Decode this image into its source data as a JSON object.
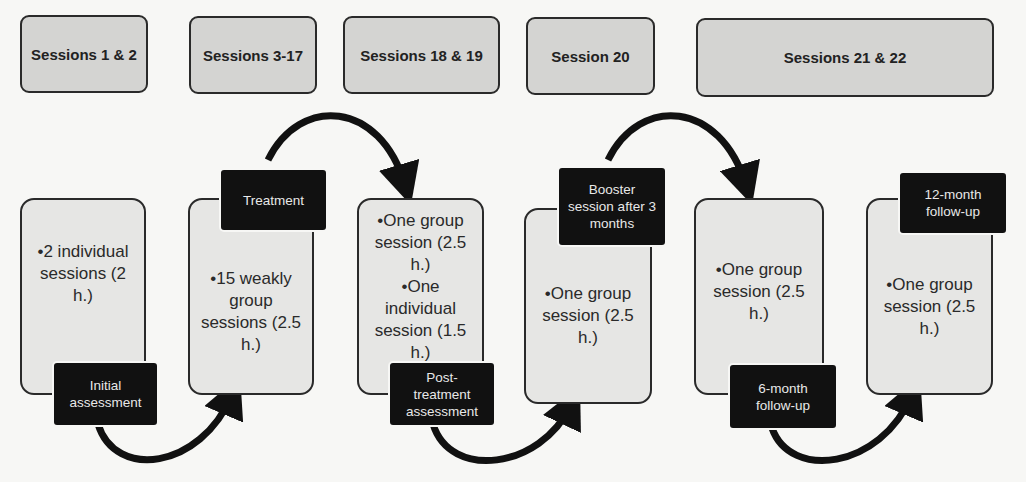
{
  "headers": [
    {
      "label": "Sessions 1 & 2"
    },
    {
      "label": "Sessions 3-17"
    },
    {
      "label": "Sessions 18 & 19"
    },
    {
      "label": "Session 20"
    },
    {
      "label": "Sessions 21 & 22"
    }
  ],
  "stages": [
    {
      "content": [
        "•2 individual sessions (2 h.)"
      ],
      "tag": "Initial assessment"
    },
    {
      "content": [
        "•15 weakly group sessions (2.5 h.)"
      ],
      "tag": "Treatment"
    },
    {
      "content": [
        "•One group session (2.5 h.)",
        "•One individual session (1.5 h.)"
      ],
      "tag": "Post-treatment assessment"
    },
    {
      "content": [
        "•One group session (2.5 h.)"
      ],
      "tag": "Booster session after 3 months"
    },
    {
      "content": [
        "•One group session (2.5 h.)"
      ],
      "tag": "6-month follow-up"
    },
    {
      "content": [
        "•One group session (2.5 h.)"
      ],
      "tag": "12-month follow-up"
    }
  ],
  "colors": {
    "header_fill": "#d4d4d2",
    "box_fill": "#e6e6e4",
    "tag_fill": "#111111",
    "arrow": "#111111"
  }
}
